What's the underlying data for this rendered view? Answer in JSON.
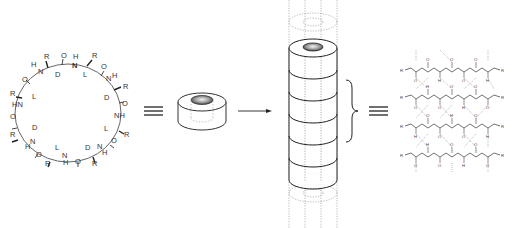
{
  "figure": {
    "panels": [
      {
        "id": "cyclic-peptide",
        "description": "Cyclic octapeptide with alternating D and L residues"
      },
      {
        "id": "ring-model",
        "description": "Ring (torus) representation"
      },
      {
        "id": "nanotube",
        "description": "Stacked rings forming a hollow tube"
      },
      {
        "id": "hbond-network",
        "description": "Antiparallel beta-sheet hydrogen bonding between stacked rings"
      }
    ],
    "equivalence_symbol": "≡",
    "arrow": "→"
  },
  "cyclic_peptide": {
    "atom_labels": {
      "top": [
        "R",
        "O",
        "H",
        "N",
        "R",
        "O"
      ],
      "stereo": [
        "D",
        "L",
        "D",
        "L",
        "D",
        "L",
        "D",
        "L"
      ],
      "residue": "R",
      "amide_n": "N",
      "amide_h": "H",
      "carbonyl_o": "O",
      "nh": "NH",
      "hn": "HN"
    }
  },
  "nanotube": {
    "ring_count": 6
  },
  "hbond_network": {
    "strand_count": 4,
    "end_group": "R"
  }
}
